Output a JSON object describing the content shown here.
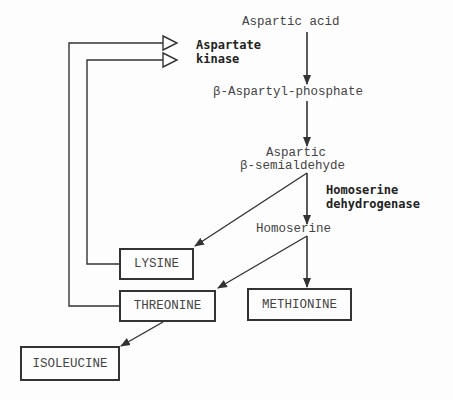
{
  "metabolites": {
    "aspartic_acid": "Aspartic acid",
    "aspartyl_phosphate": "β-Aspartyl-phosphate",
    "semialdehyde_line1": "Aspartic",
    "semialdehyde_line2": "β-semialdehyde",
    "homoserine": "Homoserine"
  },
  "enzymes": {
    "aspartate_kinase_line1": "Aspartate",
    "aspartate_kinase_line2": "kinase",
    "homoserine_dh_line1": "Homoserine",
    "homoserine_dh_line2": "dehydrogenase"
  },
  "products": {
    "lysine": "LYSINE",
    "threonine": "THREONINE",
    "methionine": "METHIONINE",
    "isoleucine": "ISOLEUCINE"
  },
  "colors": {
    "line": "#333333",
    "background": "#fdfdfd"
  }
}
